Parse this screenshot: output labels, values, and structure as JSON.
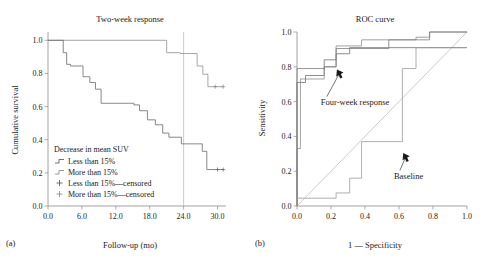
{
  "figure": {
    "panel_a_tag": "(a)",
    "panel_b_tag": "(b)"
  },
  "chart_data": [
    {
      "type": "line",
      "panel": "(a)",
      "title": "Two-week response",
      "xlabel": "Follow-up (mo)",
      "ylabel": "Cumulative survival",
      "xlim": [
        0,
        31.5
      ],
      "ylim": [
        0,
        1.05
      ],
      "xticks": [
        0,
        6,
        12,
        18,
        24,
        30
      ],
      "xticklabels": [
        "0.0",
        "6.0",
        "12.0",
        "18.0",
        "24.0",
        "30.0"
      ],
      "yticks": [
        0,
        0.2,
        0.4,
        0.6,
        0.8,
        1.0
      ],
      "yticklabels": [
        "0.0",
        "0.2",
        "0.4",
        "0.6",
        "0.8",
        "1.0"
      ],
      "grid": false,
      "vertical_reference_line_x": 24,
      "legend_title": "Decrease in mean SUV",
      "legend_position": "lower-left-inside",
      "legend": [
        {
          "label": "Less than 15%",
          "marker": "step",
          "color": "#5f5f5f"
        },
        {
          "label": "More than 15%",
          "marker": "step",
          "color": "#8f8f8f"
        },
        {
          "label": "Less than 15%—censored",
          "marker": "plus",
          "color": "#5f5f5f"
        },
        {
          "label": "More than 15%—censored",
          "marker": "plus",
          "color": "#8f8f8f"
        }
      ],
      "series": [
        {
          "name": "More than 15%",
          "color": "#8f8f8f",
          "x": [
            0,
            21.0,
            21.0,
            23.4,
            23.4,
            26.4,
            26.4,
            27.4,
            27.4,
            28.3,
            28.3,
            31.0
          ],
          "y": [
            1.0,
            1.0,
            0.925,
            0.925,
            0.92,
            0.92,
            0.845,
            0.845,
            0.795,
            0.795,
            0.72,
            0.72
          ],
          "censored_x": [
            29.6,
            31.0
          ],
          "censored_y": [
            0.72,
            0.72
          ]
        },
        {
          "name": "Less than 15%",
          "color": "#6a6a6a",
          "x": [
            0,
            2.7,
            2.7,
            3.3,
            3.3,
            4.0,
            4.0,
            6.2,
            6.2,
            7.4,
            7.4,
            8.4,
            8.4,
            9.4,
            9.4,
            15.2,
            15.2,
            16.2,
            16.2,
            17.6,
            17.6,
            19.0,
            19.0,
            20.3,
            20.3,
            21.4,
            21.4,
            23.6,
            23.6,
            27.3,
            27.3,
            28.1,
            28.1,
            31.0
          ],
          "y": [
            1.0,
            1.0,
            0.925,
            0.925,
            0.855,
            0.855,
            0.845,
            0.845,
            0.78,
            0.78,
            0.745,
            0.745,
            0.705,
            0.705,
            0.62,
            0.62,
            0.61,
            0.61,
            0.575,
            0.575,
            0.52,
            0.52,
            0.49,
            0.49,
            0.44,
            0.44,
            0.415,
            0.415,
            0.375,
            0.375,
            0.33,
            0.33,
            0.22,
            0.22
          ],
          "censored_x": [
            30.0,
            31.0
          ],
          "censored_y": [
            0.22,
            0.22
          ]
        }
      ]
    },
    {
      "type": "line",
      "panel": "(b)",
      "title": "ROC curve",
      "xlabel": "1 — Specificity",
      "ylabel": "Sensitivity",
      "xlim": [
        0,
        1.0
      ],
      "ylim": [
        0,
        1.0
      ],
      "xticks": [
        0,
        0.2,
        0.4,
        0.6,
        0.8,
        1.0
      ],
      "xticklabels": [
        "0.0",
        "0.2",
        "0.4",
        "0.6",
        "0.8",
        "1.0"
      ],
      "yticks": [
        0,
        0.2,
        0.4,
        0.6,
        0.8,
        1.0
      ],
      "yticklabels": [
        "0.0",
        "0.2",
        "0.4",
        "0.6",
        "0.8",
        "1.0"
      ],
      "grid": false,
      "diagonal_reference": true,
      "annotations": [
        {
          "text": "Four-week response",
          "x": 0.14,
          "y": 0.6,
          "arrow_to_x": 0.235,
          "arrow_to_y": 0.785
        },
        {
          "text": "Baseline",
          "x": 0.57,
          "y": 0.175,
          "arrow_to_x": 0.625,
          "arrow_to_y": 0.305
        }
      ],
      "series": [
        {
          "name": "Four-week response",
          "color": "#6e6e6e",
          "x": [
            0,
            0,
            0.05,
            0.05,
            0.16,
            0.16,
            0.23,
            0.23,
            0.31,
            0.31,
            0.54,
            0.54,
            0.7,
            0.7,
            1.0
          ],
          "y": [
            0,
            0.71,
            0.71,
            0.75,
            0.75,
            0.84,
            0.84,
            0.875,
            0.875,
            0.91,
            0.91,
            0.91,
            0.91,
            0.91,
            0.91
          ]
        },
        {
          "name": "Two-week response",
          "color": "#8a8a8a",
          "x": [
            0,
            0,
            0.02,
            0.02,
            0.08,
            0.08,
            0.16,
            0.16,
            0.23,
            0.23,
            0.38,
            0.38,
            0.54,
            0.54,
            0.7,
            0.7,
            0.78,
            0.78,
            1.0
          ],
          "y": [
            0,
            0.33,
            0.33,
            0.73,
            0.73,
            0.73,
            0.73,
            0.8,
            0.8,
            0.92,
            0.92,
            0.955,
            0.955,
            0.955,
            0.955,
            0.97,
            0.97,
            1.0,
            1.0
          ]
        },
        {
          "name": "Upper curve",
          "color": "#7c7c7c",
          "x": [
            0,
            0,
            0.03,
            0.03,
            0.16,
            0.16,
            0.23,
            0.23,
            0.31,
            0.31,
            0.54,
            0.54,
            0.62,
            0.62,
            0.78,
            0.78,
            1.0
          ],
          "y": [
            0,
            0.79,
            0.79,
            0.79,
            0.79,
            0.8,
            0.8,
            0.905,
            0.905,
            0.905,
            0.905,
            0.955,
            0.955,
            0.955,
            0.955,
            1.0,
            1.0
          ]
        },
        {
          "name": "Baseline",
          "color": "#9a9a9a",
          "x": [
            0,
            0,
            0.03,
            0.03,
            0.23,
            0.23,
            0.31,
            0.31,
            0.38,
            0.38,
            0.54,
            0.54,
            0.62,
            0.62,
            0.7,
            0.7,
            1.0
          ],
          "y": [
            0,
            0.045,
            0.045,
            0.045,
            0.045,
            0.075,
            0.075,
            0.16,
            0.16,
            0.37,
            0.37,
            0.37,
            0.37,
            0.79,
            0.79,
            0.91,
            0.91
          ]
        }
      ]
    }
  ]
}
